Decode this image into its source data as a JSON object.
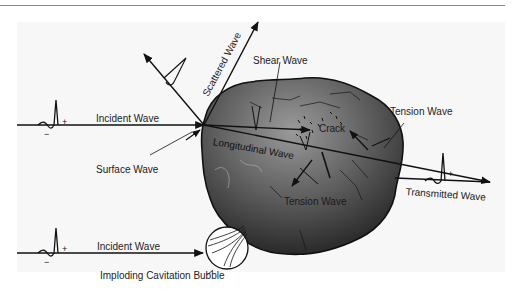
{
  "figure": {
    "colors": {
      "background": "#ffffff",
      "panel": "#f7f7f7",
      "stone_light": "#8c8c8c",
      "stone_dark": "#1c1c1c",
      "line": "#111111"
    }
  },
  "labels": {
    "incident_wave_top": "Incident Wave",
    "scattered_wave": "Scattered Wave",
    "shear_wave": "Shear Wave",
    "crack": "Crack",
    "tension_wave_right": "Tension Wave",
    "surface_wave": "Surface Wave",
    "longitudinal_wave": "Longitudinal Wave",
    "tension_wave_bottom": "Tension Wave",
    "transmitted_wave": "Transmitted Wave",
    "incident_wave_bottom": "Incident Wave",
    "imploding_bubble": "Imploding Cavitation Bubble"
  },
  "pulse_signs": {
    "plus": "+",
    "minus": "−"
  }
}
